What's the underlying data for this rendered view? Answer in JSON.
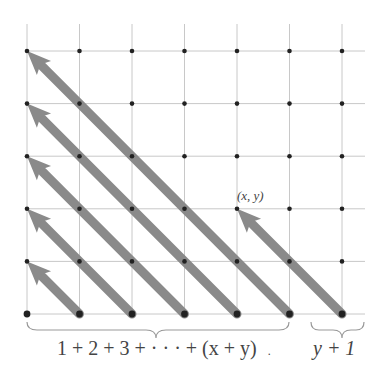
{
  "diagram": {
    "type": "lattice-diagonal-enumeration",
    "grid": {
      "columns": 7,
      "rows": 6,
      "x_positions": [
        27,
        79.5,
        132,
        184.5,
        237,
        289.5,
        342
      ],
      "y_positions": [
        51,
        103.6,
        156.2,
        208.8,
        261.4,
        314
      ],
      "line_color": "#c8c8c8",
      "dot_color": "#222222"
    },
    "arrows": [
      {
        "from": [
          1,
          0
        ],
        "to": [
          0,
          1
        ]
      },
      {
        "from": [
          2,
          0
        ],
        "to": [
          0,
          2
        ]
      },
      {
        "from": [
          3,
          0
        ],
        "to": [
          0,
          3
        ]
      },
      {
        "from": [
          4,
          0
        ],
        "to": [
          0,
          4
        ]
      },
      {
        "from": [
          5,
          0
        ],
        "to": [
          0,
          5
        ]
      },
      {
        "from": [
          6,
          0
        ],
        "to": [
          4,
          2
        ],
        "highlight": true
      }
    ],
    "arrow_color": "#8a8a8a",
    "point_label": "(x, y)",
    "brace_labels": {
      "left": "1 + 2 + 3 + · · · + (x + y)",
      "left_trailing": ".",
      "right": "y + 1"
    }
  }
}
